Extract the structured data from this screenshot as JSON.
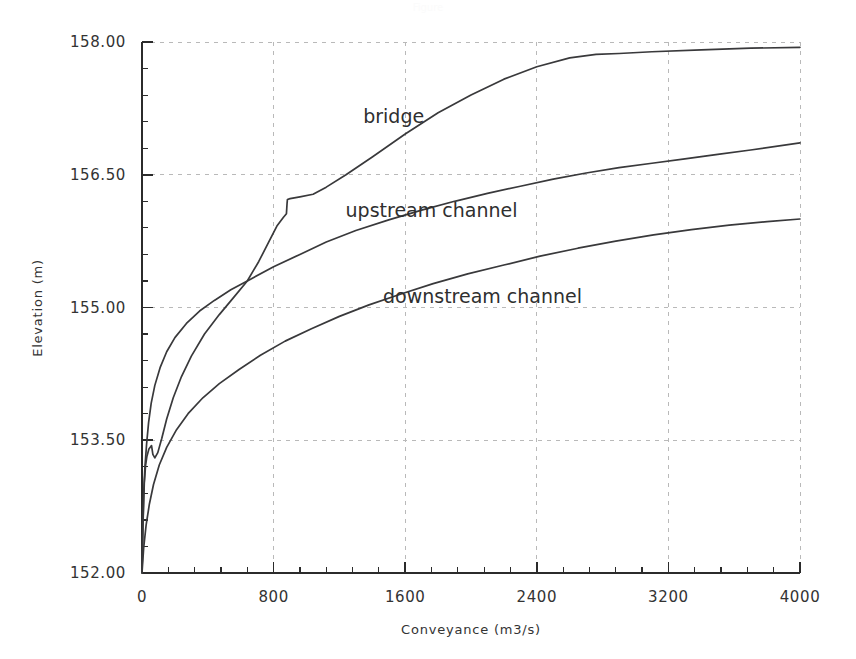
{
  "figure": {
    "width": 856,
    "height": 659,
    "background": "#ffffff",
    "faint_header": "Figure"
  },
  "chart_data": {
    "type": "line",
    "title": "",
    "xlabel": "Conveyance (m3/s)",
    "ylabel": "Elevation (m)",
    "xlim": [
      0,
      4000
    ],
    "ylim": [
      152.0,
      158.0
    ],
    "xticks": [
      0,
      800,
      1600,
      2400,
      3200,
      4000
    ],
    "yticks": [
      152.0,
      153.5,
      155.0,
      156.5,
      158.0
    ],
    "xtick_labels": [
      "0",
      "800",
      "1600",
      "2400",
      "3200",
      "4000"
    ],
    "ytick_labels": [
      "152.00",
      "153.50",
      "155.00",
      "156.50",
      "158.00"
    ],
    "x_minor_per_major": 4,
    "y_minor_per_major": 4,
    "grid": true,
    "grid_color": "#b9b9b9",
    "grid_style": "dashed",
    "legend": "inline-annotations",
    "line_color": "#39393b",
    "series": [
      {
        "name": "bridge",
        "label": "bridge",
        "label_x": 1530,
        "label_y": 157.08,
        "points": [
          [
            0,
            152.0
          ],
          [
            6,
            152.55
          ],
          [
            14,
            153.02
          ],
          [
            22,
            153.22
          ],
          [
            30,
            153.32
          ],
          [
            42,
            153.4
          ],
          [
            58,
            153.44
          ],
          [
            66,
            153.34
          ],
          [
            78,
            153.3
          ],
          [
            96,
            153.36
          ],
          [
            120,
            153.52
          ],
          [
            150,
            153.74
          ],
          [
            190,
            153.98
          ],
          [
            240,
            154.22
          ],
          [
            300,
            154.45
          ],
          [
            380,
            154.7
          ],
          [
            470,
            154.92
          ],
          [
            560,
            155.12
          ],
          [
            640,
            155.3
          ],
          [
            710,
            155.52
          ],
          [
            770,
            155.74
          ],
          [
            820,
            155.92
          ],
          [
            860,
            156.02
          ],
          [
            878,
            156.06
          ],
          [
            880,
            156.12
          ],
          [
            882,
            156.18
          ],
          [
            884,
            156.22
          ],
          [
            900,
            156.23
          ],
          [
            960,
            156.25
          ],
          [
            1040,
            156.28
          ],
          [
            1120,
            156.36
          ],
          [
            1240,
            156.5
          ],
          [
            1400,
            156.7
          ],
          [
            1600,
            156.96
          ],
          [
            1800,
            157.2
          ],
          [
            2000,
            157.4
          ],
          [
            2200,
            157.58
          ],
          [
            2400,
            157.72
          ],
          [
            2600,
            157.82
          ],
          [
            2760,
            157.86
          ],
          [
            2900,
            157.87
          ],
          [
            3100,
            157.89
          ],
          [
            3400,
            157.91
          ],
          [
            3700,
            157.93
          ],
          [
            4000,
            157.94
          ]
        ]
      },
      {
        "name": "upstream channel",
        "label": "upstream channel",
        "label_x": 1760,
        "label_y": 156.02,
        "points": [
          [
            0,
            152.0
          ],
          [
            4,
            152.4
          ],
          [
            10,
            152.9
          ],
          [
            18,
            153.2
          ],
          [
            28,
            153.46
          ],
          [
            40,
            153.7
          ],
          [
            56,
            153.92
          ],
          [
            78,
            154.12
          ],
          [
            110,
            154.32
          ],
          [
            150,
            154.5
          ],
          [
            200,
            154.66
          ],
          [
            270,
            154.82
          ],
          [
            350,
            154.96
          ],
          [
            440,
            155.08
          ],
          [
            540,
            155.2
          ],
          [
            660,
            155.32
          ],
          [
            800,
            155.46
          ],
          [
            960,
            155.6
          ],
          [
            1120,
            155.74
          ],
          [
            1300,
            155.87
          ],
          [
            1500,
            155.99
          ],
          [
            1700,
            156.1
          ],
          [
            1900,
            156.2
          ],
          [
            2100,
            156.29
          ],
          [
            2300,
            156.37
          ],
          [
            2500,
            156.45
          ],
          [
            2700,
            156.52
          ],
          [
            2900,
            156.58
          ],
          [
            3100,
            156.63
          ],
          [
            3300,
            156.68
          ],
          [
            3500,
            156.73
          ],
          [
            3700,
            156.78
          ],
          [
            4000,
            156.86
          ]
        ]
      },
      {
        "name": "downstream channel",
        "label": "downstream channel",
        "label_x": 2070,
        "label_y": 155.05,
        "points": [
          [
            0,
            152.0
          ],
          [
            10,
            152.28
          ],
          [
            25,
            152.54
          ],
          [
            45,
            152.78
          ],
          [
            70,
            153.0
          ],
          [
            105,
            153.22
          ],
          [
            150,
            153.42
          ],
          [
            210,
            153.62
          ],
          [
            280,
            153.8
          ],
          [
            370,
            153.98
          ],
          [
            470,
            154.14
          ],
          [
            590,
            154.3
          ],
          [
            720,
            154.46
          ],
          [
            870,
            154.62
          ],
          [
            1030,
            154.76
          ],
          [
            1200,
            154.9
          ],
          [
            1380,
            155.03
          ],
          [
            1570,
            155.15
          ],
          [
            1770,
            155.27
          ],
          [
            1980,
            155.38
          ],
          [
            2200,
            155.48
          ],
          [
            2420,
            155.58
          ],
          [
            2650,
            155.67
          ],
          [
            2880,
            155.75
          ],
          [
            3110,
            155.82
          ],
          [
            3340,
            155.88
          ],
          [
            3570,
            155.93
          ],
          [
            3800,
            155.97
          ],
          [
            4000,
            156.0
          ]
        ]
      }
    ]
  }
}
